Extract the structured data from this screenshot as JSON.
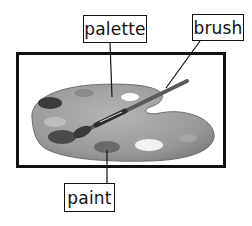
{
  "diagram": {
    "type": "labeled illustration",
    "labels": [
      {
        "id": "palette",
        "text": "palette"
      },
      {
        "id": "brush",
        "text": "brush"
      },
      {
        "id": "paint",
        "text": "paint"
      }
    ],
    "colors": {
      "frame": "#111111",
      "palette_wood": "#9a9a9a",
      "paint_dark": "#4a4a4a",
      "paint_light": "#f2f2f2"
    }
  }
}
